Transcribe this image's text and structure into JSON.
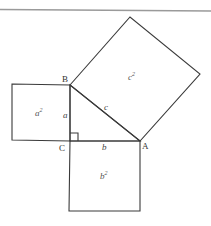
{
  "diagram": {
    "vertices": {
      "A": {
        "label": "A",
        "x": 140,
        "y": 141
      },
      "B": {
        "label": "B",
        "x": 70,
        "y": 85
      },
      "C": {
        "label": "C",
        "x": 70,
        "y": 141
      }
    },
    "sides": {
      "a": "a",
      "b": "b",
      "c": "c"
    },
    "squares": {
      "a_sq": {
        "base": "a",
        "exp": "2"
      },
      "b_sq": {
        "base": "b",
        "exp": "2"
      },
      "c_sq": {
        "base": "c",
        "exp": "2"
      }
    },
    "colors": {
      "line": "#3a3a3a",
      "rule": "#9a9a9a",
      "background": "#ffffff"
    }
  }
}
